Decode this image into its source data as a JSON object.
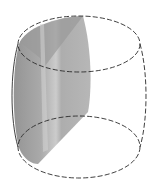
{
  "figure": {
    "colors": {
      "background": "#ffffff",
      "outline": "#2a2a2a",
      "shade_dark": "#8c8c8c",
      "shade_mid": "#a6a6a6",
      "shade_light": "#bdbdbd",
      "highlight_band": "#d0d0d0"
    },
    "components": [
      {
        "name": "top-base",
        "style": "dashed ellipse"
      },
      {
        "name": "bottom-base",
        "style": "dashed ellipse"
      },
      {
        "name": "lateral-surface",
        "style": "bulging sides, left solid, right dashed"
      },
      {
        "name": "cross-section",
        "style": "shaded gray region"
      }
    ]
  }
}
